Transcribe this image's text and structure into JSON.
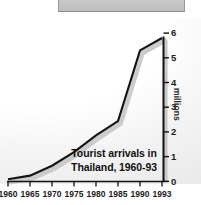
{
  "figure": {
    "top_strip_name": "cropped-gray-panel"
  },
  "chart_data": {
    "type": "line",
    "title": "Tourist arrivals in Thailand, 1960-93",
    "title_line_1": "Tourist arrivals in",
    "title_line_2": "Thailand, 1960-93",
    "xlabel": "",
    "ylabel": "millions",
    "x": [
      1960,
      1965,
      1970,
      1975,
      1980,
      1985,
      1990,
      1993
    ],
    "values": [
      0.08,
      0.23,
      0.63,
      1.18,
      1.86,
      2.44,
      5.3,
      5.8
    ],
    "categories": [
      "1960",
      "1965",
      "1970",
      "1975",
      "1980",
      "1985",
      "1990",
      "1993"
    ],
    "xtick_labels": [
      "1960",
      "1965",
      "1970",
      "1975",
      "1980",
      "1985",
      "1990",
      "1993"
    ],
    "ytick_labels": [
      "0",
      "1",
      "2",
      "3",
      "4",
      "5",
      "6"
    ],
    "ytick_values": [
      0,
      1,
      2,
      3,
      4,
      5,
      6
    ],
    "ylim": [
      0,
      6
    ],
    "xlim": [
      1960,
      1993
    ],
    "grid": false,
    "legend": false,
    "series": [
      {
        "name": "Tourist arrivals",
        "values": [
          0.08,
          0.23,
          0.63,
          1.18,
          1.86,
          2.44,
          5.3,
          5.8
        ]
      }
    ],
    "colors": {
      "line": "#111111",
      "shadow": "#c6c6c6",
      "axis": "#111111",
      "text": "#1c1c1c",
      "background": "#ffffff"
    }
  }
}
